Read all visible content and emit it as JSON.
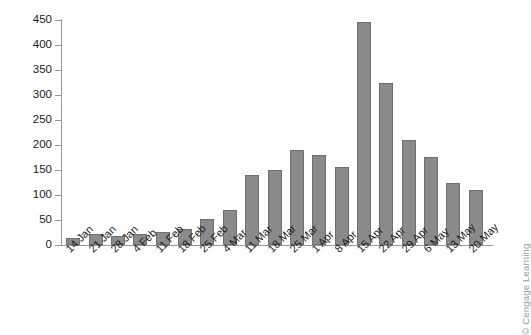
{
  "chart_data": {
    "type": "bar",
    "title": "",
    "xlabel": "",
    "ylabel": "",
    "ylim": [
      0,
      450
    ],
    "ytick_step": 50,
    "yticks": [
      0,
      50,
      100,
      150,
      200,
      250,
      300,
      350,
      400,
      450
    ],
    "ytick_labels": [
      "0",
      "50",
      "100",
      "150",
      "200",
      "250",
      "300",
      "350",
      "400",
      "450"
    ],
    "grid": false,
    "legend": null,
    "bar_color": "#8a8a8a",
    "bar_edge_color": "#6f6f6f",
    "axis_color": "#9a9a9a",
    "categories": [
      "14 Jan",
      "21 Jan",
      "28 Jan",
      "4 Feb",
      "11 Feb",
      "18 Feb",
      "25 Feb",
      "4 Mar",
      "11 Mar",
      "18 Mar",
      "25 Mar",
      "1 Apr",
      "8 Apr",
      "15 Apr",
      "22 Apr",
      "29 Apr",
      "6 May",
      "13 May",
      "20 May"
    ],
    "values": [
      15,
      23,
      18,
      22,
      26,
      33,
      53,
      71,
      140,
      150,
      190,
      180,
      157,
      447,
      325,
      210,
      177,
      125,
      110
    ]
  },
  "credit": {
    "text": "© Cengage Learning"
  }
}
